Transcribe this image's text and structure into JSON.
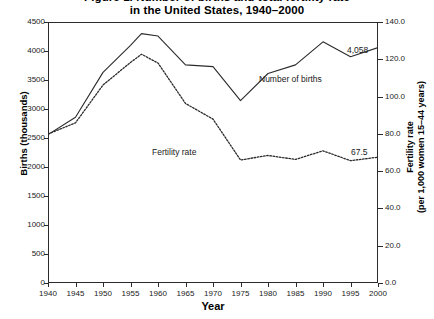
{
  "chart_data": {
    "type": "line",
    "title": "Figure 1. Number of births and total fertility rate",
    "title_lines": [
      "Figure 1. Number of births and total fertility rate",
      "in the United States, 1940–2000"
    ],
    "xlabel": "Year",
    "ylabel": "Births (thousands)",
    "y2label_lines": [
      "Fertility rate",
      "(per 1,000 women 15–44 years)"
    ],
    "grid": false,
    "legend_position": "inline-annotations",
    "xlim": [
      1940,
      2000
    ],
    "ylim": [
      0,
      4500
    ],
    "y2lim": [
      0.0,
      140.0
    ],
    "xticks": [
      1940,
      1945,
      1950,
      1955,
      1960,
      1965,
      1970,
      1975,
      1980,
      1985,
      1990,
      1995,
      2000
    ],
    "xticklabels": [
      "1940",
      "1945",
      "1950",
      "1955",
      "1960",
      "1965",
      "1970",
      "1975",
      "1980",
      "1985",
      "1990",
      "1995",
      "2000"
    ],
    "yticks": [
      0,
      500,
      1000,
      1500,
      2000,
      2500,
      3000,
      3500,
      4000,
      4500
    ],
    "yticklabels": [
      "0",
      "500",
      "1000",
      "1500",
      "2000",
      "2500",
      "3000",
      "3500",
      "4000",
      "4500"
    ],
    "y2ticks": [
      0.0,
      20.0,
      40.0,
      60.0,
      80.0,
      100.0,
      120.0,
      140.0
    ],
    "y2ticklabels": [
      "0.0",
      "20.0",
      "40.0",
      "60.0",
      "80.0",
      "100.0",
      "120.0",
      "140.0"
    ],
    "x": [
      1940,
      1945,
      1950,
      1955,
      1957,
      1960,
      1965,
      1970,
      1975,
      1980,
      1985,
      1990,
      1995,
      2000
    ],
    "series": [
      {
        "name": "Number of births",
        "axis": "left",
        "style": "solid",
        "color": "#2b2b2b",
        "values": [
          2559,
          2858,
          3632,
          4097,
          4300,
          4258,
          3760,
          3731,
          3144,
          3612,
          3761,
          4158,
          3900,
          4058
        ]
      },
      {
        "name": "Fertility rate",
        "axis": "right",
        "style": "dotted",
        "color": "#2b2b2b",
        "values": [
          79.9,
          85.9,
          106.2,
          118.3,
          122.7,
          118.0,
          96.3,
          87.9,
          66.0,
          68.4,
          66.3,
          70.9,
          65.6,
          67.5
        ]
      }
    ],
    "annotations": [
      {
        "text": "Number of births",
        "for_series": "Number of births"
      },
      {
        "text": "Fertility rate",
        "for_series": "Fertility rate"
      },
      {
        "text": "4,058",
        "for_series": "Number of births",
        "at_x": 2000,
        "value": 4058
      },
      {
        "text": "67.5",
        "for_series": "Fertility rate",
        "at_x": 2000,
        "value": 67.5
      }
    ]
  },
  "colors": {
    "axis": "#2b2b2b",
    "text": "#1a1a1a",
    "background": "#ffffff"
  }
}
